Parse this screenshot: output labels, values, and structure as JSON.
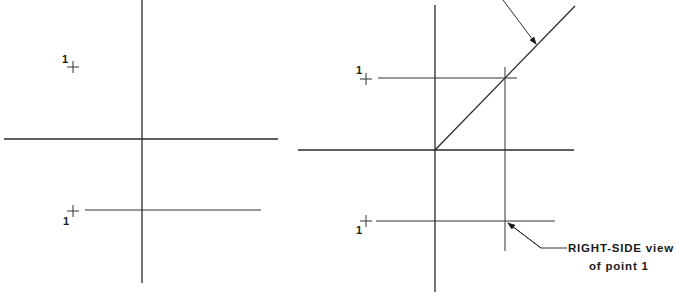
{
  "diagram": {
    "colors": {
      "line": "#2a2a2a",
      "background": "#ffffff",
      "text": "#1a1a1a"
    },
    "left_panel": {
      "point_top_label": "1",
      "point_front_label": "1"
    },
    "right_panel": {
      "point_top_label": "1",
      "point_front_label": "1",
      "callout": {
        "line1": "RIGHT-SIDE view",
        "line2": "of point 1"
      }
    }
  }
}
